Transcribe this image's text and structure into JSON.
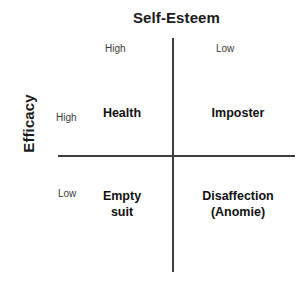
{
  "diagram": {
    "type": "2x2-matrix",
    "x_axis": {
      "title": "Self-Esteem",
      "levels": [
        "High",
        "Low"
      ]
    },
    "y_axis": {
      "title": "Efficacy",
      "levels": [
        "High",
        "Low"
      ]
    },
    "quadrants": {
      "high_esteem_high_efficacy": "Health",
      "low_esteem_high_efficacy": "Imposter",
      "high_esteem_low_efficacy": "Empty\nsuit",
      "low_esteem_low_efficacy": "Disaffection\n(Anomie)"
    },
    "colors": {
      "background": "#ffffff",
      "axis_line": "#3d3d3d",
      "title_text": "#1a1a1a",
      "level_text": "#3a3a3a",
      "quadrant_text": "#111111"
    }
  }
}
